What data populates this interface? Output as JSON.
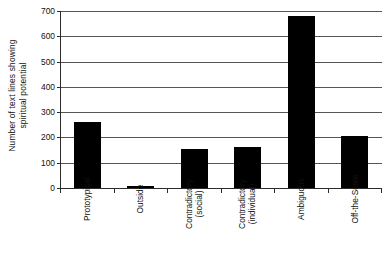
{
  "chart_data": {
    "type": "bar",
    "title": "",
    "xlabel": "",
    "ylabel": "Number of text lines showing spiritual potential",
    "ylabel_lines": [
      "Number of text lines showing",
      "spiritual potential"
    ],
    "categories": [
      "Prototypical",
      "Outside",
      "Contradictory (social)",
      "Contradictory (individual)",
      "Ambiguous",
      "Off-the-Scale"
    ],
    "category_lines": [
      [
        "Prototypical"
      ],
      [
        "Outside"
      ],
      [
        "Contradictory",
        "(social)"
      ],
      [
        "Contradictory",
        "(individual)"
      ],
      [
        "Ambiguous"
      ],
      [
        "Off-the-Scale"
      ]
    ],
    "values": [
      261,
      9,
      155,
      162,
      681,
      205
    ],
    "ylim": [
      0,
      700
    ],
    "yticks": [
      0,
      100,
      200,
      300,
      400,
      500,
      600,
      700
    ],
    "ytick_labels": [
      "0",
      "100",
      "200",
      "300",
      "400",
      "500",
      "600",
      "700"
    ],
    "grid": "horizontal",
    "legend": "none",
    "bar_color": "#000000",
    "axis_color": "#2b2b2b",
    "grid_color": "#555555",
    "background": "#ffffff"
  }
}
